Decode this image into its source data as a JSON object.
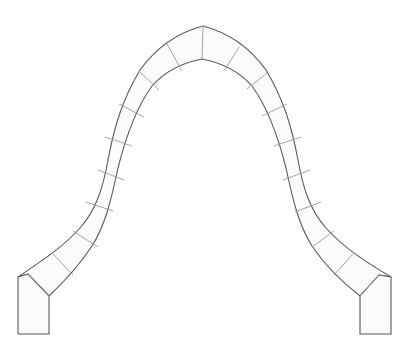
{
  "diagram": {
    "colors": {
      "background": "#ffffff",
      "fill": "#fbfbfb",
      "outline": "#5a5a5a",
      "joint": "#9a9a9a"
    },
    "arch": {
      "outer_path": "M18,277 C40,262 62,248 80,228 C96,210 103,188 108,160 C114,128 122,100 140,70 C158,45 180,32 203,26 C226,32 248,45 266,70 C284,100 292,128 298,160 C303,188 310,210 326,228 C344,248 366,262 391,277",
      "inner_path": "M360,296 C342,282 324,264 312,246 C298,224 292,196 286,168 C278,136 268,108 252,86 C236,68 218,62 202,59 C186,62 168,68 152,86 C136,108 126,136 118,168 C112,196 106,224 92,246 C80,264 64,282 49,296",
      "voussoir_joints": [
        {
          "x1": 203,
          "y1": 26,
          "x2": 202,
          "y2": 59
        },
        {
          "x1": 167,
          "y1": 44,
          "x2": 182,
          "y2": 71
        },
        {
          "x1": 139,
          "y1": 71,
          "x2": 159,
          "y2": 90
        },
        {
          "x1": 119,
          "y1": 104,
          "x2": 144,
          "y2": 117
        },
        {
          "x1": 105,
          "y1": 137,
          "x2": 132,
          "y2": 146
        },
        {
          "x1": 98,
          "y1": 170,
          "x2": 124,
          "y2": 180
        },
        {
          "x1": 86,
          "y1": 202,
          "x2": 113,
          "y2": 211
        },
        {
          "x1": 73,
          "y1": 231,
          "x2": 98,
          "y2": 247
        },
        {
          "x1": 53,
          "y1": 254,
          "x2": 73,
          "y2": 275
        },
        {
          "x1": 28,
          "y1": 274,
          "x2": 49,
          "y2": 296
        },
        {
          "x1": 239,
          "y1": 47,
          "x2": 224,
          "y2": 71
        },
        {
          "x1": 267,
          "y1": 73,
          "x2": 247,
          "y2": 89
        },
        {
          "x1": 287,
          "y1": 104,
          "x2": 262,
          "y2": 116
        },
        {
          "x1": 301,
          "y1": 137,
          "x2": 274,
          "y2": 146
        },
        {
          "x1": 310,
          "y1": 170,
          "x2": 283,
          "y2": 180
        },
        {
          "x1": 321,
          "y1": 202,
          "x2": 295,
          "y2": 212
        },
        {
          "x1": 334,
          "y1": 231,
          "x2": 312,
          "y2": 247
        },
        {
          "x1": 353,
          "y1": 254,
          "x2": 334,
          "y2": 275
        },
        {
          "x1": 379,
          "y1": 275,
          "x2": 360,
          "y2": 296
        }
      ]
    },
    "piers": [
      {
        "name": "left",
        "points": "18,277 28,274 49,296 49,334 18,334"
      },
      {
        "name": "right",
        "points": "391,277 379,275 360,296 360,334 391,334"
      }
    ]
  }
}
